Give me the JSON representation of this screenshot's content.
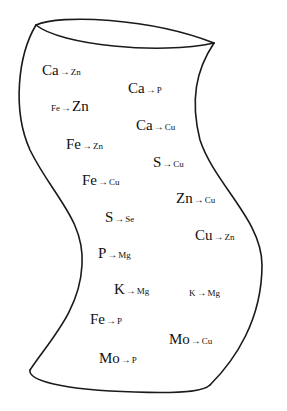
{
  "diagram": {
    "shape": "curved-cylinder",
    "stroke_color": "#1a1a1a",
    "labels": [
      {
        "from": "Ca",
        "to": "Zn",
        "x": 42,
        "y": 62,
        "style": "normal"
      },
      {
        "from": "Ca",
        "to": "P",
        "x": 128,
        "y": 80,
        "style": "normal"
      },
      {
        "from": "Fe",
        "to": "Zn",
        "x": 51,
        "y": 98,
        "style": "big-tail"
      },
      {
        "from": "Ca",
        "to": "Cu",
        "x": 136,
        "y": 117,
        "style": "normal"
      },
      {
        "from": "Fe",
        "to": "Zn",
        "x": 66,
        "y": 136,
        "style": "normal"
      },
      {
        "from": "S",
        "to": "Cu",
        "x": 153,
        "y": 154,
        "style": "normal"
      },
      {
        "from": "Fe",
        "to": "Cu",
        "x": 82,
        "y": 172,
        "style": "normal"
      },
      {
        "from": "Zn",
        "to": "Cu",
        "x": 176,
        "y": 190,
        "style": "normal"
      },
      {
        "from": "S",
        "to": "Se",
        "x": 105,
        "y": 209,
        "style": "normal"
      },
      {
        "from": "Cu",
        "to": "Zn",
        "x": 195,
        "y": 227,
        "style": "normal"
      },
      {
        "from": "P",
        "to": "Mg",
        "x": 98,
        "y": 245,
        "style": "normal"
      },
      {
        "from": "K",
        "to": "Mg",
        "x": 114,
        "y": 281,
        "style": "normal"
      },
      {
        "from": "K",
        "to": "Mg",
        "x": 189,
        "y": 283,
        "style": "small"
      },
      {
        "from": "Fe",
        "to": "P",
        "x": 90,
        "y": 311,
        "style": "normal"
      },
      {
        "from": "Mo",
        "to": "Cu",
        "x": 169,
        "y": 331,
        "style": "normal"
      },
      {
        "from": "Mo",
        "to": "P",
        "x": 99,
        "y": 350,
        "style": "normal"
      }
    ],
    "arrow_glyph": "→"
  }
}
